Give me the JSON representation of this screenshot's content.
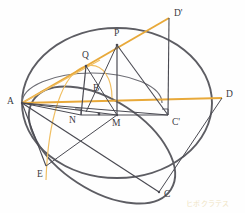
{
  "figure": {
    "width": 245,
    "height": 213,
    "background_color": "#fefefe"
  },
  "colors": {
    "dark_stroke": "#5d5d63",
    "thin_stroke": "#4a4a52",
    "accent_orange": "#e8a93a",
    "accent_orange_light": "#f0bf63",
    "label_color": "#3a3a42",
    "watermark_color": "#efe4c4"
  },
  "points": [
    {
      "id": "A",
      "label": "A",
      "x": 22,
      "y": 103,
      "label_x": 7,
      "label_y": 97
    },
    {
      "id": "B",
      "label": "B",
      "x": 96,
      "y": 97,
      "label_x": 93,
      "label_y": 84
    },
    {
      "id": "C",
      "label": "C",
      "x": 159,
      "y": 192,
      "label_x": 164,
      "label_y": 190
    },
    {
      "id": "Cp",
      "label": "C'",
      "x": 168,
      "y": 115,
      "label_x": 172,
      "label_y": 118
    },
    {
      "id": "D",
      "label": "D",
      "x": 222,
      "y": 98,
      "label_x": 226,
      "label_y": 90
    },
    {
      "id": "Dp",
      "label": "D'",
      "x": 169,
      "y": 18,
      "label_x": 174,
      "label_y": 9
    },
    {
      "id": "E",
      "label": "E",
      "x": 46,
      "y": 166,
      "label_x": 37,
      "label_y": 170
    },
    {
      "id": "M",
      "label": "M",
      "x": 117,
      "y": 115,
      "label_x": 112,
      "label_y": 119
    },
    {
      "id": "N",
      "label": "N",
      "x": 81,
      "y": 115,
      "label_x": 69,
      "label_y": 116
    },
    {
      "id": "P",
      "label": "P",
      "x": 117,
      "y": 45,
      "label_x": 114,
      "label_y": 29
    },
    {
      "id": "Q",
      "label": "Q",
      "x": 86,
      "y": 66,
      "label_x": 82,
      "label_y": 51
    }
  ],
  "shapes": {
    "great_circle": {
      "name": "great-circle",
      "cx": 117,
      "cy": 103,
      "rx": 95,
      "ry": 75,
      "rotation": 0
    },
    "base_ellipse": {
      "name": "base-ellipse-tilted",
      "cx": 102,
      "cy": 145,
      "rx": 82,
      "ry": 45,
      "rotation": 33
    },
    "inner_ellipse_arc": {
      "name": "inner-section-ellipse",
      "cx": 100,
      "cy": 107,
      "rx": 70,
      "ry": 30,
      "rotation": 0
    },
    "orange_arc": {
      "name": "orange-section-curve",
      "description": "orange curve through Q descending left"
    }
  },
  "segments": [
    {
      "name": "segment-A-Dprime",
      "from": "A",
      "to": "Dp",
      "color": "accent_orange",
      "width": 1.6
    },
    {
      "name": "segment-A-D",
      "from": "A",
      "to": "D",
      "color": "accent_orange",
      "width": 1.6
    },
    {
      "name": "segment-A-Q",
      "from": "A",
      "to": "Q",
      "color": "accent_orange_light",
      "width": 1.2
    },
    {
      "name": "segment-A-C",
      "from": "A",
      "to": "C",
      "color": "thin_stroke",
      "width": 1.1
    },
    {
      "name": "segment-A-E",
      "from": "A",
      "to": "E",
      "color": "thin_stroke",
      "width": 1.1
    },
    {
      "name": "segment-A-M",
      "from": "A",
      "to": "M",
      "color": "thin_stroke",
      "width": 1.0
    },
    {
      "name": "segment-A-N",
      "from": "A",
      "to": "N",
      "color": "thin_stroke",
      "width": 1.0
    },
    {
      "name": "segment-A-Cprime",
      "from": "A",
      "to": "Cp",
      "color": "thin_stroke",
      "width": 1.0
    },
    {
      "name": "segment-P-M",
      "from": "P",
      "to": "M",
      "color": "thin_stroke",
      "width": 1.1
    },
    {
      "name": "segment-P-Cprime",
      "from": "P",
      "to": "Cp",
      "color": "thin_stroke",
      "width": 1.1
    },
    {
      "name": "segment-P-B",
      "from": "P",
      "to": "B",
      "color": "thin_stroke",
      "width": 1.0
    },
    {
      "name": "segment-Q-N",
      "from": "Q",
      "to": "N",
      "color": "thin_stroke",
      "width": 1.1
    },
    {
      "name": "segment-Q-M",
      "from": "Q",
      "to": "M",
      "color": "thin_stroke",
      "width": 1.0
    },
    {
      "name": "segment-Dprime-Cprime",
      "from": "Dp",
      "to": "Cp",
      "color": "thin_stroke",
      "width": 1.0
    },
    {
      "name": "segment-D-C",
      "from": "D",
      "to": "C",
      "color": "thin_stroke",
      "width": 1.0
    },
    {
      "name": "segment-E-M",
      "from": "E",
      "to": "M",
      "color": "thin_stroke",
      "width": 1.0
    },
    {
      "name": "segment-M-Cprime",
      "from": "M",
      "to": "Cp",
      "color": "thin_stroke",
      "width": 1.0
    },
    {
      "name": "segment-N-M",
      "from": "N",
      "to": "M",
      "color": "thin_stroke",
      "width": 1.0
    }
  ],
  "markers": {
    "right_angle_at_N": {
      "name": "right-angle-marker-N",
      "x": 81,
      "y": 115,
      "size": 6
    },
    "right_angle_at_Cprime": {
      "name": "right-angle-marker-Cprime",
      "x": 168,
      "y": 115,
      "size": 6
    },
    "center_dot": {
      "name": "center-dot",
      "x": 99,
      "y": 114,
      "r": 1.4
    }
  },
  "watermark": {
    "text": "ヒポクラテス",
    "x": 186,
    "y": 198
  }
}
